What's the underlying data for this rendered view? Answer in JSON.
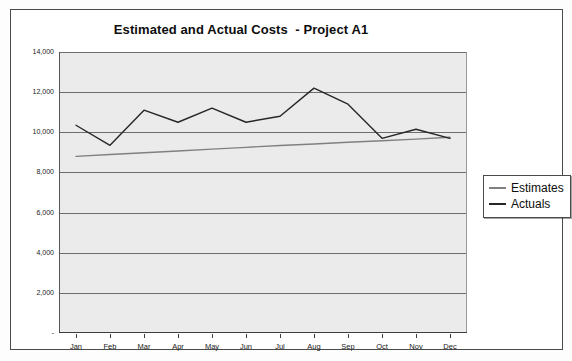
{
  "chart": {
    "title": "Estimated and Actual Costs  - Project A1"
  },
  "legend": {
    "position": "right-outside",
    "items": [
      {
        "label": "Estimates",
        "color": "#808080"
      },
      {
        "label": "Actuals",
        "color": "#262626"
      }
    ]
  },
  "chart_data": {
    "type": "line",
    "title": "Estimated and Actual Costs  - Project A1",
    "xlabel": "",
    "ylabel": "",
    "categories": [
      "Jan",
      "Feb",
      "Mar",
      "Apr",
      "May",
      "Jun",
      "Jul",
      "Aug",
      "Sep",
      "Oct",
      "Nov",
      "Dec"
    ],
    "series": [
      {
        "name": "Estimates",
        "color": "#808080",
        "values": [
          8800,
          8890,
          8980,
          9070,
          9160,
          9250,
          9340,
          9420,
          9500,
          9580,
          9660,
          9750
        ]
      },
      {
        "name": "Actuals",
        "color": "#262626",
        "values": [
          10350,
          9350,
          11100,
          10500,
          11200,
          10500,
          10800,
          12200,
          11400,
          9700,
          10150,
          9700
        ]
      }
    ],
    "ylim": [
      0,
      14000
    ],
    "ytick_values": [
      0,
      2000,
      4000,
      6000,
      8000,
      10000,
      12000,
      14000
    ],
    "ytick_labels": [
      "-",
      "2,000",
      "4,000",
      "6,000",
      "8,000",
      "10,000",
      "12,000",
      "14,000"
    ],
    "grid": true,
    "grid_axis": "y",
    "legend_position": "right"
  }
}
